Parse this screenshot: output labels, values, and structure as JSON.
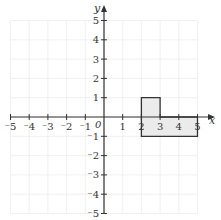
{
  "diagram": {
    "type": "coordinate-grid",
    "x_axis_label": "x",
    "y_axis_label": "y",
    "origin_label": "0",
    "x_range": [
      -5,
      5
    ],
    "y_range": [
      -5,
      5
    ],
    "x_tick_labels": [
      "⁻5",
      "⁻4",
      "⁻3",
      "⁻2",
      "⁻1",
      "1",
      "2",
      "3",
      "4",
      "5"
    ],
    "x_tick_values": [
      -5,
      -4,
      -3,
      -2,
      -1,
      1,
      2,
      3,
      4,
      5
    ],
    "y_tick_labels": [
      "5",
      "4",
      "3",
      "2",
      "1",
      "⁻1",
      "⁻2",
      "⁻3",
      "⁻4",
      "⁻5"
    ],
    "y_tick_values": [
      5,
      4,
      3,
      2,
      1,
      -1,
      -2,
      -3,
      -4,
      -5
    ],
    "grid": true,
    "shape": {
      "name": "L-shaped polygon",
      "vertices": [
        [
          2,
          1
        ],
        [
          3,
          1
        ],
        [
          3,
          0
        ],
        [
          5,
          0
        ],
        [
          5,
          -1
        ],
        [
          2,
          -1
        ]
      ],
      "fill": "#ebebeb",
      "stroke": "#333333"
    },
    "colors": {
      "grid": "#ececec",
      "axis": "#333333",
      "shape_fill": "#ebebeb"
    }
  }
}
